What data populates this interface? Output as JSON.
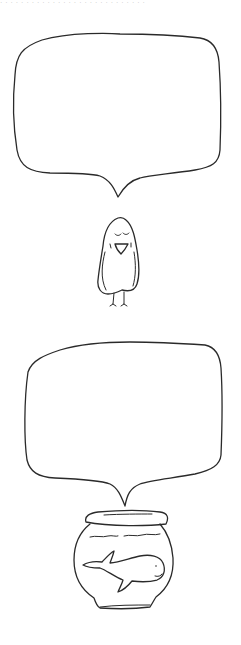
{
  "header": {
    "cropped_text": "· · · ·  · · · · · · · ·  · · · · · · · · ·  · · · · · · ·"
  },
  "panels": [
    {
      "id": "bird-panel",
      "speech_bubble": {
        "text": ""
      },
      "character": "bird"
    },
    {
      "id": "fishbowl-panel",
      "speech_bubble": {
        "text": ""
      },
      "character": "whale-in-fishbowl"
    }
  ],
  "colors": {
    "background": "#ffffff",
    "ink": "#2a2a2a"
  },
  "icons": {
    "bird": "bird-drawing-icon",
    "fishbowl": "fishbowl-icon",
    "whale": "whale-icon"
  }
}
